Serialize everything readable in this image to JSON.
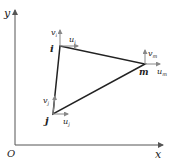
{
  "axes": {
    "origin_label": "O",
    "x_label": "x",
    "y_label": "y"
  },
  "nodes": [
    {
      "id": "i",
      "label": "i",
      "u_label": "u",
      "u_sub": "i",
      "v_label": "v",
      "v_sub": "i"
    },
    {
      "id": "j",
      "label": "j",
      "u_label": "u",
      "u_sub": "j",
      "v_label": "v",
      "v_sub": "j"
    },
    {
      "id": "m",
      "label": "m",
      "u_label": "u",
      "u_sub": "m",
      "v_label": "v",
      "v_sub": "m"
    }
  ],
  "colors": {
    "line": "#222222",
    "arrow": "#888888"
  }
}
